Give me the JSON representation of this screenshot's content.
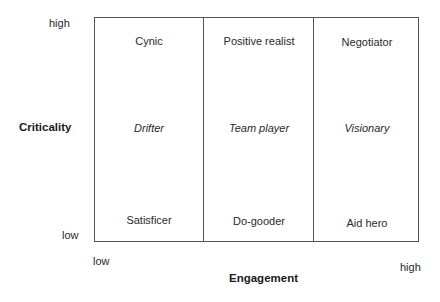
{
  "y_axis": {
    "title": "Criticality",
    "high_label": "high",
    "low_label": "low"
  },
  "x_axis": {
    "title": "Engagement",
    "low_label": "low",
    "high_label": "high"
  },
  "grid": {
    "columns": 3,
    "rows": 3,
    "cells": [
      [
        {
          "label": "Cynic",
          "italic": false
        },
        {
          "label": "Positive realist",
          "italic": false
        },
        {
          "label": "Negotiator",
          "italic": false
        }
      ],
      [
        {
          "label": "Drifter",
          "italic": true
        },
        {
          "label": "Team player",
          "italic": true
        },
        {
          "label": "Visionary",
          "italic": true
        }
      ],
      [
        {
          "label": "Satisficer",
          "italic": false
        },
        {
          "label": "Do-gooder",
          "italic": false
        },
        {
          "label": "Aid hero",
          "italic": false
        }
      ]
    ]
  }
}
